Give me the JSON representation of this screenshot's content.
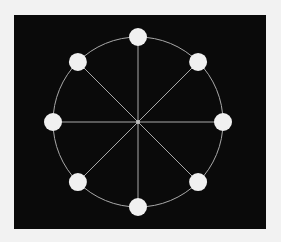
{
  "diagram": {
    "type": "radial-graph",
    "background": "#f2f2f2",
    "panel": {
      "x": 14,
      "y": 15,
      "width": 252,
      "height": 214,
      "fill": "#0a0a0a"
    },
    "center": {
      "x": 138,
      "y": 122,
      "radius": 2,
      "fill": "#bfbfbf"
    },
    "ring": {
      "radius": 85,
      "stroke": "#a8a8a8",
      "stroke_width": 1
    },
    "spoke_style": {
      "stroke": "#a8a8a8",
      "stroke_width": 1
    },
    "node_style": {
      "radius": 9,
      "fill": "#f0f0f0"
    },
    "nodes": [
      {
        "id": "n-top",
        "angle_deg": 90
      },
      {
        "id": "n-top-right",
        "angle_deg": 45
      },
      {
        "id": "n-right",
        "angle_deg": 0
      },
      {
        "id": "n-bottom-right",
        "angle_deg": -45
      },
      {
        "id": "n-bottom",
        "angle_deg": -90
      },
      {
        "id": "n-bottom-left",
        "angle_deg": -135
      },
      {
        "id": "n-left",
        "angle_deg": 180
      },
      {
        "id": "n-top-left",
        "angle_deg": 135
      }
    ]
  }
}
